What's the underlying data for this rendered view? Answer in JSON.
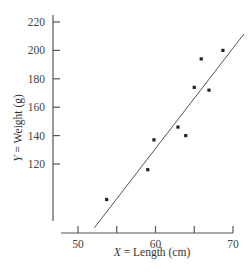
{
  "chart_data": {
    "type": "scatter",
    "title": "",
    "xlabel": "X = Length (cm)",
    "xlabel_var": "X",
    "xlabel_rest": " = Length (cm)",
    "ylabel": "Y = Weight (g)",
    "ylabel_var": "Y",
    "ylabel_rest": " = Weight (g)",
    "xlim": [
      47.8,
      70
    ],
    "ylim": [
      80,
      220
    ],
    "x_ticks": [
      50,
      55,
      60,
      65,
      70
    ],
    "x_tick_labels": [
      "50",
      "",
      "60",
      "",
      "70"
    ],
    "y_ticks": [
      120,
      140,
      160,
      180,
      200,
      220
    ],
    "y_tick_labels": [
      "120",
      "140",
      "160",
      "180",
      "200",
      "220"
    ],
    "grid": false,
    "legend": null,
    "points": [
      {
        "x": 53.7,
        "y": 95
      },
      {
        "x": 59.0,
        "y": 116
      },
      {
        "x": 59.8,
        "y": 137
      },
      {
        "x": 62.9,
        "y": 146
      },
      {
        "x": 63.9,
        "y": 140
      },
      {
        "x": 65.0,
        "y": 174
      },
      {
        "x": 65.9,
        "y": 194
      },
      {
        "x": 66.9,
        "y": 172
      },
      {
        "x": 68.7,
        "y": 200
      }
    ],
    "fit_line": {
      "label": "least-squares regression line",
      "x0": 52.1,
      "y0": 75,
      "x1": 71.4,
      "y1": 211.5
    },
    "colors": {
      "axis": "#555555",
      "points": "#222222",
      "line": "#555555",
      "text": "#444444"
    }
  },
  "layout": {
    "x_axis_px": {
      "y": 233,
      "x_start": 61,
      "x_end": 233,
      "val_at_start": 50,
      "px_per_unit": 7.75,
      "origin_val": 50,
      "origin_px": 78
    },
    "y_axis_px": {
      "x": 53,
      "y_top": 15,
      "y_bottom": 221,
      "origin_val": 220,
      "origin_px": 22,
      "px_per_unit": 1.42
    }
  }
}
